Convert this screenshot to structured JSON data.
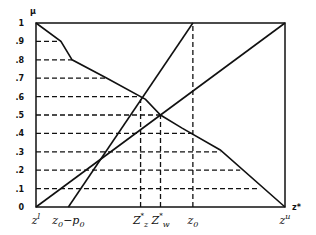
{
  "chart_data": {
    "type": "line",
    "title": "",
    "ylabel": "μ",
    "xlabel": "z*",
    "ylim": [
      0,
      1
    ],
    "grid": false,
    "y_ticks": [
      "0",
      ".1",
      ".2",
      ".3",
      ".4",
      ".5",
      ".6",
      ".7",
      ".8",
      ".9",
      "1"
    ],
    "x_tick_labels": [
      {
        "label": "z^l",
        "x": 0.0
      },
      {
        "label": "z0-p0",
        "x": 0.13
      },
      {
        "label": "Z_z*",
        "x": 0.42
      },
      {
        "label": "Z_w*",
        "x": 0.5
      },
      {
        "label": "z0",
        "x": 0.63
      },
      {
        "label": "z^u",
        "x": 1.0
      }
    ],
    "series": [
      {
        "name": "piecewise linear decreasing membership",
        "style": "solid",
        "points": [
          [
            0.0,
            1.0
          ],
          [
            0.1,
            0.9
          ],
          [
            0.145,
            0.8
          ],
          [
            0.285,
            0.7
          ],
          [
            0.44,
            0.585
          ],
          [
            0.5,
            0.5
          ],
          [
            0.585,
            0.43
          ],
          [
            0.74,
            0.31
          ],
          [
            1.0,
            0.0
          ]
        ]
      },
      {
        "name": "linear increasing (z0-p0 to z0)",
        "style": "solid",
        "points": [
          [
            0.13,
            0.0
          ],
          [
            0.63,
            1.0
          ]
        ]
      },
      {
        "name": "linear increasing (z^l to z^u)",
        "style": "solid",
        "points": [
          [
            0.0,
            0.0
          ],
          [
            1.0,
            1.0
          ]
        ]
      }
    ],
    "dashed_horizontals": [
      {
        "y": 0.9,
        "x_end": 0.1
      },
      {
        "y": 0.8,
        "x_end": 0.145
      },
      {
        "y": 0.7,
        "x_end": 0.285
      },
      {
        "y": 0.6,
        "x_end": 0.42
      },
      {
        "y": 0.5,
        "x_end": 0.5
      },
      {
        "y": 0.4,
        "x_end": 0.63
      },
      {
        "y": 0.3,
        "x_end": 0.74
      },
      {
        "y": 0.2,
        "x_end": 0.82
      },
      {
        "y": 0.1,
        "x_end": 0.9
      }
    ],
    "dashed_verticals": [
      {
        "label": "Z_z*",
        "x": 0.42,
        "y_top": 0.585
      },
      {
        "label": "Z_w*",
        "x": 0.5,
        "y_top": 0.5
      },
      {
        "label": "z0",
        "x": 0.63,
        "y_top": 1.0
      }
    ]
  },
  "labels": {
    "y_axis": "μ",
    "x_axis": "z*",
    "ticks_y": [
      "0",
      ".1",
      ".2",
      ".3",
      ".4",
      ".5",
      ".6",
      ".7",
      ".8",
      ".9",
      "1"
    ]
  }
}
